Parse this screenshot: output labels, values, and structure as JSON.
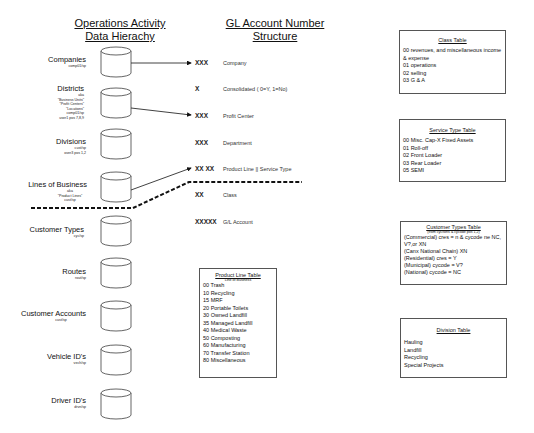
{
  "left_column": {
    "title_line1": "Operations Activity",
    "title_line2": "Data Hierachy",
    "entities": [
      {
        "label": "Companies",
        "sub": [
          "comp01/sp"
        ]
      },
      {
        "label": "Districts",
        "sub": [
          "aka",
          "\"Business Units\"",
          "\"Profit Centers\"",
          "\"Locations\"",
          "comp01/sp",
          "user1 pos 7,8,9"
        ]
      },
      {
        "label": "Divisions",
        "sub": [
          "cust/sp",
          "over3 pos 1,2"
        ]
      },
      {
        "label": "Lines of Business",
        "sub": [
          "aka",
          "\"Product Lines\"",
          "cust/sp"
        ]
      },
      {
        "label": "Customer Types",
        "sub": [
          "cyc/sp"
        ]
      },
      {
        "label": "Routes",
        "sub": [
          "rout/sp"
        ]
      },
      {
        "label": "Customer Accounts",
        "sub": [
          "cust/sp"
        ]
      },
      {
        "label": "Vehicle ID's",
        "sub": [
          "vech/sp"
        ]
      },
      {
        "label": "Driver ID's",
        "sub": [
          "drvn/sp"
        ]
      }
    ]
  },
  "gl_structure": {
    "title_line1": "GL Account Number",
    "title_line2": "Structure",
    "segments": [
      {
        "code": "XXX",
        "desc": "Company"
      },
      {
        "code": "X",
        "desc": "Consolidated  ( 0=Y, 1=No)"
      },
      {
        "code": "XXX",
        "desc": "Profit Center"
      },
      {
        "code": "XXX",
        "desc": "Department"
      },
      {
        "code": "XX XX",
        "desc": "Product Line || Service Type"
      },
      {
        "code": "XX",
        "desc": "Class"
      },
      {
        "code": "XXXXX",
        "desc": "G/L Account"
      }
    ]
  },
  "product_line_table": {
    "title": "Product Line Table",
    "subtitle": "\"Line of Business\"",
    "items": [
      "00 Trash",
      "10 Recycling",
      "15 MRF",
      "20 Portable Toilets",
      "30 Owned Landfill",
      "35 Managed Landfill",
      "40 Medical Waste",
      "50 Composting",
      "60 Manufacturing",
      "70 Transfer Station",
      "80  Miscellaneous"
    ]
  },
  "class_table": {
    "title": "Class Table",
    "items": [
      "00 revenues, and miscellaneous income & expense",
      "01 operations",
      "02 selling",
      "03 G & A"
    ]
  },
  "service_type_table": {
    "title": "Service Type Table",
    "items": [
      "00  Misc. Cap-X Fixed Assets",
      "01  Roll-off",
      "02  Front Loader",
      "03  Rear Loader",
      "05 SEMI"
    ]
  },
  "customer_types_table": {
    "title": "Customer Types Table",
    "subtitle": "(from cyc/tons & cycode pos 1,2)",
    "items": [
      "(Commercial) cres = n & cycode ne NC, V?,or XN",
      "(Canx National Chain)  XN",
      "(Residential) cres = Y",
      "(Municipal) cycode = V?",
      "(National) cycode = NC"
    ]
  },
  "division_table": {
    "title": "Division Table",
    "items": [
      "Hauling",
      "Landfill",
      "Recycling",
      "Special Projects"
    ]
  }
}
